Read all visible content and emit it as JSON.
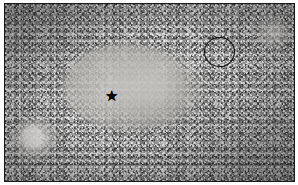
{
  "figure": {
    "kind": "histopathology-micrograph",
    "stain_appearance": "grayscale",
    "background_color": "#ffffff",
    "border_color": "#1a1a1a",
    "tissue_base_color": "#8d8d8d",
    "pale_core_color": "#c4c2be",
    "annotation_color": "#0d0d0d",
    "plate": {
      "x": 4,
      "y": 3,
      "width": 291,
      "height": 179
    }
  },
  "annotations": {
    "star": {
      "glyph": "★",
      "name": "star-marker",
      "label": "",
      "x_pct": 36.8,
      "y_pct": 51.4,
      "size_px": 15,
      "color": "#080808",
      "marks": "pale hypocellular central zone"
    },
    "circle": {
      "name": "circle-annotation",
      "label": "",
      "x_pct": 68.8,
      "y_pct": 18.5,
      "width_pct": 10.7,
      "height_pct": 17.3,
      "stroke_color": "#0d0d0d",
      "stroke_width_px": 1.6,
      "marks": "highlighted round structure"
    }
  },
  "regions": [
    {
      "name": "pale-central-zone",
      "description": "pale hypocellular area"
    },
    {
      "name": "dense-cellular-periphery",
      "description": "dark granular cellular tissue"
    },
    {
      "name": "vessel-lower-left",
      "description": "pale vessel-like structure"
    },
    {
      "name": "vessel-top-right",
      "description": "pale structure at corner"
    }
  ]
}
